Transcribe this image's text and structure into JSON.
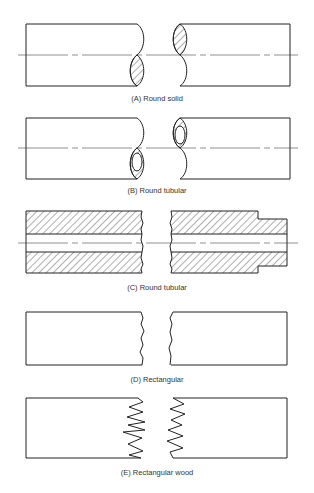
{
  "figure": {
    "panels": [
      {
        "id": "A",
        "caption": "(A) Round solid",
        "shape": "round solid",
        "break": "S-break with hatched solid section"
      },
      {
        "id": "B",
        "caption": "(B) Round tubular",
        "shape": "round tubular",
        "break": "S-break with hatched ring section"
      },
      {
        "id": "C",
        "caption": "(C) Round tubular",
        "shape": "round tubular (sectioned)",
        "break": "irregular break line, hatched walls, stepped end"
      },
      {
        "id": "D",
        "caption": "(D) Rectangular",
        "shape": "rectangular",
        "break": "freehand wavy break line"
      },
      {
        "id": "E",
        "caption": "(E) Rectangular wood",
        "shape": "rectangular wood",
        "break": "zigzag splinter break"
      }
    ]
  },
  "colors": {
    "line": "#222222",
    "centerline": "#444444",
    "background": "#ffffff"
  }
}
